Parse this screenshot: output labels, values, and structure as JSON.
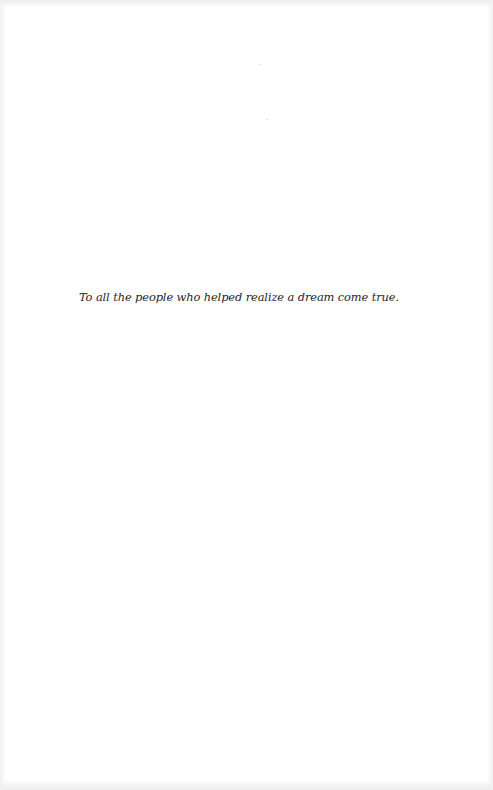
{
  "page": {
    "type": "dedication",
    "dedication_text": "To all the people who helped realize a dream come true."
  },
  "colors": {
    "paper": "#ffffff",
    "text": "#1f1f1f"
  }
}
